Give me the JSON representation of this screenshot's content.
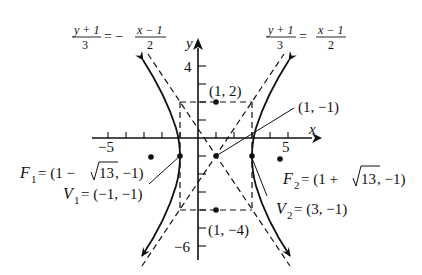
{
  "figure": {
    "type": "hyperbola",
    "center": {
      "label": "(1, −1)",
      "x": 1,
      "y": -1
    },
    "box_top": {
      "label": "(1, 2)",
      "x": 1,
      "y": 2
    },
    "box_bottom": {
      "label": "(1, −4)",
      "x": 1,
      "y": -4
    },
    "vertex1": {
      "name": "V",
      "sub": "1",
      "value": "= (−1, −1)",
      "x": -1,
      "y": -1
    },
    "vertex2": {
      "name": "V",
      "sub": "2",
      "value": "= (3, −1)",
      "x": 3,
      "y": -1
    },
    "focus1": {
      "name": "F",
      "sub": "1",
      "value_pre": "= (1 − ",
      "sqrt": "13",
      "value_post": ", −1)",
      "x": -2.606,
      "y": -1
    },
    "focus2": {
      "name": "F",
      "sub": "2",
      "value_pre": "= (1 + ",
      "sqrt": "13",
      "value_post": ", −1)",
      "x": 4.606,
      "y": -1
    },
    "asymptote_left": {
      "lhs_num": "y + 1",
      "lhs_den": "3",
      "eq": "= −",
      "rhs_num": "x − 1",
      "rhs_den": "2"
    },
    "asymptote_right": {
      "lhs_num": "y + 1",
      "lhs_den": "3",
      "eq": "=",
      "rhs_num": "x − 1",
      "rhs_den": "2"
    }
  },
  "axes": {
    "x_label": "x",
    "y_label": "y",
    "x_tick_labels": [
      {
        "value": -5,
        "label": "−5"
      },
      {
        "value": 5,
        "label": "5"
      }
    ],
    "y_tick_labels": [
      {
        "value": 4,
        "label": "4"
      },
      {
        "value": -6,
        "label": "−6"
      }
    ],
    "x_range": [
      -5,
      5
    ],
    "y_range": [
      -6,
      4
    ]
  }
}
